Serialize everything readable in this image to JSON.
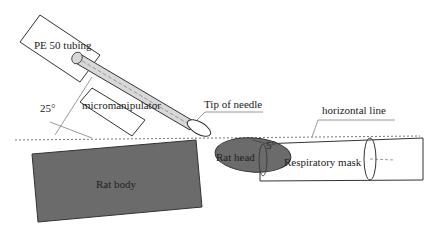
{
  "diagram": {
    "labels": {
      "pe_tubing": "PE 50 tubing",
      "angle_needle": "25°",
      "micromanipulator": "micromanipulator",
      "tip_of_needle": "Tip of needle",
      "horizontal_line": "horizontal line",
      "rat_body": "Rat body",
      "rat_head": "Rat head",
      "angle_head": "5°",
      "respiratory_mask": "Respiratory mask"
    },
    "colors": {
      "rat_fill": "#6b6b6b",
      "outline": "#333333",
      "needle_fill": "#d8d8d8"
    }
  }
}
